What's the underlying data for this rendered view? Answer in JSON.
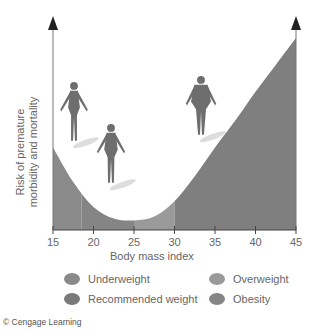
{
  "chart_data": {
    "type": "area",
    "title": "",
    "xlabel": "Body mass index",
    "ylabel": "Risk of premature morbidity and mortality",
    "ylabel_lines": [
      "Risk of premature",
      "morbidity and mortality"
    ],
    "x_ticks": [
      15,
      20,
      25,
      30,
      35,
      40,
      45
    ],
    "xlim": [
      15,
      45
    ],
    "ylim": [
      0,
      1
    ],
    "y_ticks": [],
    "grid": false,
    "legend_position": "bottom",
    "series": [
      {
        "name": "Relative risk (U-shaped curve)",
        "x": [
          15,
          17.5,
          20,
          22.5,
          25,
          27.5,
          30,
          32.5,
          35,
          37.5,
          40,
          42.5,
          45
        ],
        "values": [
          0.43,
          0.25,
          0.12,
          0.06,
          0.05,
          0.07,
          0.15,
          0.28,
          0.43,
          0.57,
          0.72,
          0.86,
          1.0
        ]
      }
    ],
    "regions": [
      {
        "name": "Underweight",
        "x_range": [
          15,
          18.5
        ],
        "color": "#8a8a8a"
      },
      {
        "name": "Recommended weight",
        "x_range": [
          18.5,
          25
        ],
        "color": "#858585"
      },
      {
        "name": "Overweight",
        "x_range": [
          25,
          30
        ],
        "color": "#9a9a9a"
      },
      {
        "name": "Obesity",
        "x_range": [
          30,
          45
        ],
        "color": "#7f7f7f"
      }
    ],
    "annotations": [
      "Thin figure near BMI 18",
      "Average figure near BMI 23",
      "Heavy figure near BMI 36"
    ]
  },
  "legend": [
    {
      "label": "Underweight",
      "color": "#8a8a8a"
    },
    {
      "label": "Recommended weight",
      "color": "#7a7a7a"
    },
    {
      "label": "Overweight",
      "color": "#9a9a9a"
    },
    {
      "label": "Obesity",
      "color": "#858585"
    }
  ],
  "credit": "© Cengage Learning"
}
